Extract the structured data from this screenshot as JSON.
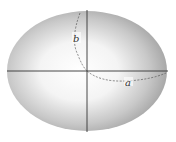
{
  "header": {
    "clipped_text": "· · · ·"
  },
  "diagram": {
    "title": "",
    "shape": "ellipse",
    "center": [
      87,
      71
    ],
    "semi_major_label": "a",
    "semi_minor_label": "b",
    "colors": {
      "edge": "#9a9a9a",
      "center": "#ffffff",
      "axis": "#333333",
      "dash": "#555555"
    }
  }
}
